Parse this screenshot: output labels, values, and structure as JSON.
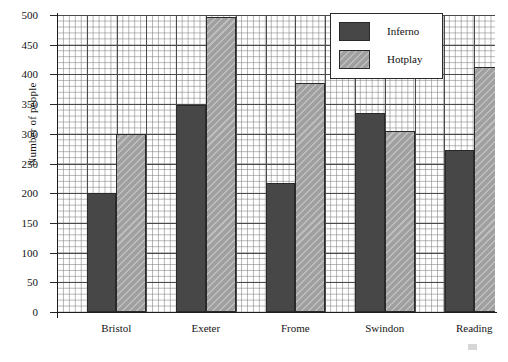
{
  "chart_data": {
    "type": "bar",
    "title": "",
    "xlabel": "",
    "ylabel": "Number of people",
    "ylim": [
      0,
      500
    ],
    "ytick_step": 50,
    "yticks": [
      0,
      50,
      100,
      150,
      200,
      250,
      300,
      350,
      400,
      450,
      500
    ],
    "grid": true,
    "grid_minor": true,
    "legend_position": "top-right",
    "categories": [
      "Bristol",
      "Exeter",
      "Frome",
      "Swindon",
      "Reading"
    ],
    "series": [
      {
        "name": "Inferno",
        "color": "#474747",
        "pattern": "solid",
        "values": [
          200,
          348,
          217,
          335,
          273
        ]
      },
      {
        "name": "Hotplay",
        "color": "#a0a0a0",
        "pattern": "diagonal-hatch",
        "values": [
          299,
          497,
          385,
          305,
          412
        ]
      }
    ]
  },
  "legend": {
    "entries": [
      {
        "label": "Inferno"
      },
      {
        "label": "Hotplay"
      }
    ]
  },
  "axes": {
    "y_title": "Number of people",
    "y_tick_labels": [
      "500",
      "450",
      "400",
      "350",
      "300",
      "250",
      "200",
      "150",
      "100",
      "50",
      "0"
    ],
    "x_tick_labels": [
      "Bristol",
      "Exeter",
      "Frome",
      "Swindon",
      "Reading"
    ]
  },
  "colors": {
    "inferno": "#474747",
    "hotplay": "#a0a0a0",
    "axis": "#1d1d1d",
    "grid_major": "#4a4a4a",
    "grid_minor": "#7d7d7d",
    "background": "#ffffff"
  }
}
